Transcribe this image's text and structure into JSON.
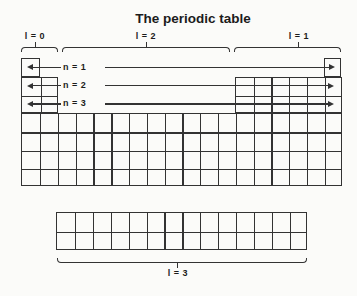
{
  "title": "The periodic table",
  "colors": {
    "line": "#333333",
    "text": "#1c1c1c",
    "background": "#fbfbf9"
  },
  "labels": {
    "l0": "l = 0",
    "l1": "l = 1",
    "l2": "l = 2",
    "l3": "l = 3",
    "n1": "n = 1",
    "n2": "n = 2",
    "n3": "n = 3"
  },
  "figure": {
    "blocks": [
      {
        "name": "s-block-row1",
        "x": 21.3,
        "y": 58.3,
        "cols": 1,
        "rows": 1,
        "cw": 18.5,
        "rh": 18.25
      },
      {
        "name": "p-block-row1",
        "x": 323.7,
        "y": 58.3,
        "cols": 1,
        "rows": 1,
        "cw": 17.79,
        "rh": 18.25
      },
      {
        "name": "s-block-rows2-3",
        "x": 21.3,
        "y": 76.5,
        "cols": 2,
        "rows": 2,
        "cw": 18.5,
        "rh": 18.25
      },
      {
        "name": "p-block-rows2-3",
        "x": 234.8,
        "y": 76.5,
        "cols": 6,
        "rows": 2,
        "cw": 17.79,
        "rh": 18.25
      },
      {
        "name": "main-rows4-7",
        "x": 21.3,
        "y": 113.0,
        "cols": 18,
        "rows": 4,
        "cw": 17.79,
        "rh": 18.25
      },
      {
        "name": "f-block",
        "x": 56.0,
        "y": 212.0,
        "cols": 14,
        "rows": 2,
        "cw": 17.9,
        "rh": 19.0
      }
    ],
    "brackets": [
      {
        "name": "l0-bracket",
        "x1": 20.5,
        "x2": 58.0,
        "y": 46.5,
        "dir": "down",
        "tick": 34.5
      },
      {
        "name": "l2-bracket",
        "x1": 62.0,
        "x2": 230.0,
        "y": 46.5,
        "dir": "down",
        "tick": 146.0
      },
      {
        "name": "l1-bracket",
        "x1": 234.0,
        "x2": 341.0,
        "y": 46.5,
        "dir": "down",
        "tick": 298.0
      },
      {
        "name": "l3-bracket",
        "x1": 57.0,
        "x2": 307.0,
        "y": 262.5,
        "dir": "up",
        "tick": 177.0
      }
    ],
    "arrows": [
      {
        "name": "n1",
        "y": 67.4,
        "leftTip": 27,
        "leftEnd": 61,
        "rightStart": 104.5,
        "rightTip": 335
      },
      {
        "name": "n2",
        "y": 85.6,
        "leftTip": 27,
        "leftEnd": 61,
        "rightStart": 104.5,
        "rightTip": 334
      },
      {
        "name": "n3",
        "y": 103.9,
        "leftTip": 27,
        "leftEnd": 61,
        "rightStart": 104.5,
        "rightTip": 334
      }
    ]
  }
}
